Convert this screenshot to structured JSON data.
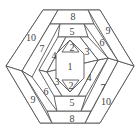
{
  "diagram": {
    "type": "hexagonal log cabin quilt block piecing order",
    "stroke_color": "#555555",
    "label_color": "#444444",
    "pieces": [
      {
        "id": "p1",
        "label": "1",
        "x": 70,
        "y": 66
      },
      {
        "id": "p2a",
        "label": "2",
        "x": 73,
        "y": 47
      },
      {
        "id": "p2b",
        "label": "2",
        "x": 72,
        "y": 84
      },
      {
        "id": "p3a",
        "label": "3",
        "x": 87,
        "y": 51
      },
      {
        "id": "p3b",
        "label": "3",
        "x": 57,
        "y": 81
      },
      {
        "id": "p4a",
        "label": "4",
        "x": 54,
        "y": 55
      },
      {
        "id": "p4b",
        "label": "4",
        "x": 89,
        "y": 77
      },
      {
        "id": "p5a",
        "label": "5",
        "x": 72,
        "y": 31
      },
      {
        "id": "p5b",
        "label": "5",
        "x": 72,
        "y": 101
      },
      {
        "id": "p6a",
        "label": "6",
        "x": 102,
        "y": 42
      },
      {
        "id": "p6b",
        "label": "6",
        "x": 46,
        "y": 91
      },
      {
        "id": "p7a",
        "label": "7",
        "x": 42,
        "y": 48
      },
      {
        "id": "p7b",
        "label": "7",
        "x": 103,
        "y": 87
      },
      {
        "id": "p8a",
        "label": "8",
        "x": 73,
        "y": 15
      },
      {
        "id": "p8b",
        "label": "8",
        "x": 72,
        "y": 118
      },
      {
        "id": "p9a",
        "label": "9",
        "x": 108,
        "y": 30
      },
      {
        "id": "p9b",
        "label": "9",
        "x": 33,
        "y": 99
      },
      {
        "id": "p10a",
        "label": "10",
        "x": 31,
        "y": 37
      },
      {
        "id": "p10b",
        "label": "10",
        "x": 106,
        "y": 101
      }
    ]
  }
}
